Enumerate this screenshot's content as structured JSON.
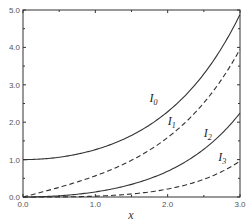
{
  "chart_data": {
    "type": "line",
    "title": "",
    "xlabel": "x",
    "ylabel": "",
    "xlim": [
      0,
      3
    ],
    "ylim": [
      0,
      5
    ],
    "grid": false,
    "x": [
      0,
      0.25,
      0.5,
      0.75,
      1.0,
      1.25,
      1.5,
      1.75,
      2.0,
      2.25,
      2.5,
      2.75,
      3.0
    ],
    "series": [
      {
        "name": "I0",
        "base": "I",
        "sub": "0",
        "style": "solid",
        "values": [
          1.0,
          1.0157,
          1.0635,
          1.1456,
          1.2661,
          1.4296,
          1.6467,
          1.9196,
          2.2796,
          2.741,
          3.2898,
          4.0007,
          4.8808
        ]
      },
      {
        "name": "I1",
        "base": "I",
        "sub": "1",
        "style": "dashed",
        "values": [
          0.0,
          0.126,
          0.2579,
          0.3988,
          0.5652,
          0.7553,
          0.9817,
          1.25,
          1.5906,
          2.0047,
          2.5167,
          3.1461,
          3.9534
        ]
      },
      {
        "name": "I2",
        "base": "I",
        "sub": "2",
        "style": "solid",
        "values": [
          0.0,
          0.0079,
          0.0319,
          0.0729,
          0.1357,
          0.2222,
          0.3378,
          0.488,
          0.6889,
          0.9456,
          1.2765,
          1.702,
          2.2452
        ]
      },
      {
        "name": "I3",
        "base": "I",
        "sub": "3",
        "style": "dashed",
        "values": [
          0.0,
          0.0003,
          0.0026,
          0.0091,
          0.0222,
          0.0445,
          0.0807,
          0.1338,
          0.2127,
          0.3236,
          0.4743,
          0.6777,
          0.9598
        ]
      }
    ],
    "xticks": [
      "0.0",
      "1.0",
      "2.0",
      "3.0"
    ],
    "yticks": [
      "0.0",
      "1.0",
      "2.0",
      "3.0",
      "4.0",
      "5.0"
    ],
    "annotations": [
      {
        "text": "I0",
        "x": 1.75,
        "y": 2.55
      },
      {
        "text": "I1",
        "x": 2.0,
        "y": 1.92
      },
      {
        "text": "I2",
        "x": 2.5,
        "y": 1.6
      },
      {
        "text": "I3",
        "x": 2.7,
        "y": 0.95
      }
    ]
  }
}
